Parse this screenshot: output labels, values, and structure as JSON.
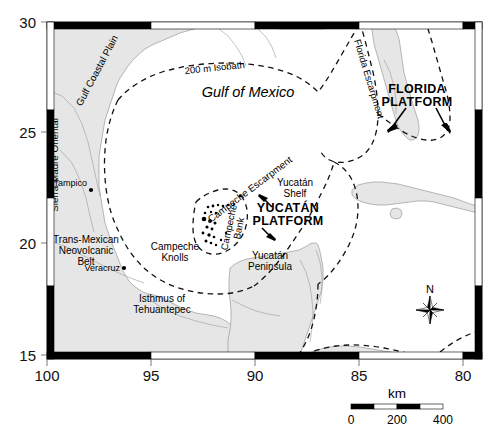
{
  "figure": {
    "kind": "locator-map",
    "title_hidden": "Gulf of Mexico bathymetric locator map"
  },
  "axes": {
    "x": {
      "label": "",
      "ticks": [
        "100",
        "95",
        "90",
        "85",
        "80"
      ],
      "values": [
        100,
        95,
        90,
        85,
        80
      ],
      "range": [
        100.8,
        79.2
      ],
      "unit": "degrees west longitude"
    },
    "y": {
      "label": "",
      "ticks": [
        "30",
        "25",
        "20",
        "15"
      ],
      "values": [
        30,
        25,
        20,
        15
      ],
      "range": [
        15,
        30.3
      ],
      "unit": "degrees north latitude"
    },
    "frame_style": "alternating-black-white"
  },
  "map_labels": {
    "ocean": "Gulf of Mexico",
    "isobath": "200 m Isobath",
    "florida_escarpment": "Florida Escarpment",
    "florida_platform": [
      "FLORIDA",
      "PLATFORM"
    ],
    "campeche_escarpment": "Campeche Escarpment",
    "yucatan_shelf": [
      "Yucatán",
      "Shelf"
    ],
    "yucatan_platform": [
      "YUCATÁN",
      "PLATFORM"
    ],
    "campeche_bank": [
      "Campeche",
      "Bank"
    ],
    "campeche_knolls": [
      "Campeche",
      "Knolls"
    ],
    "yucatan_peninsula": [
      "Yucatán",
      "Peninsula"
    ],
    "isthmus": [
      "Isthmus of",
      "Tehuantepec"
    ],
    "sierra_madre": "Sierra Madre Oriental",
    "gulf_coastal_plain": "Gulf Coastal Plain",
    "trans_mexican": [
      "Trans-Mexican",
      "Neovolcanic",
      "Belt"
    ],
    "cities": [
      {
        "name": "Tampico",
        "lon": 97.9,
        "lat": 22.25
      },
      {
        "name": "Veracruz",
        "lon": 96.15,
        "lat": 19.2
      }
    ]
  },
  "scalebar": {
    "unit_label": "km",
    "tick_labels": [
      "0",
      "200",
      "400"
    ],
    "tick_values": [
      0,
      200,
      400
    ],
    "segments": 4,
    "segment_km": 100
  },
  "compass": {
    "north_label": "N",
    "icon": "compass-rose-icon",
    "points": 8
  },
  "colors": {
    "land": "#e6e6e6",
    "land_stroke": "#9a9a9a",
    "water": "#ffffff",
    "frame": "#000000",
    "dashed": "#1a1a1a",
    "text": "#000000"
  }
}
